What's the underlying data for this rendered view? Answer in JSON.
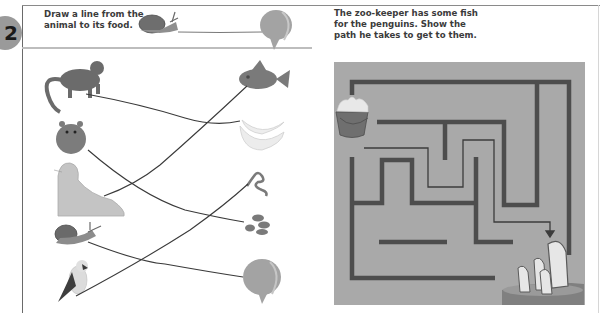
{
  "page": {
    "page_number": "2",
    "colors": {
      "page_number_bg": "#9a9a9a",
      "maze_bg": "#a9a9a9",
      "maze_wall": "#4d4d4d",
      "drawn_line": "#3a3a3a",
      "header_rule": "#bdbdbd"
    }
  },
  "activity_matching": {
    "instruction_line1": "Draw a line from the",
    "instruction_line2": "animal to its food.",
    "example": {
      "animal": "snail",
      "food": "lettuce"
    },
    "animals": [
      {
        "name": "monkey",
        "icon": "monkey-icon"
      },
      {
        "name": "hamster",
        "icon": "hamster-icon"
      },
      {
        "name": "seal",
        "icon": "seal-icon"
      },
      {
        "name": "snail",
        "icon": "snail-icon"
      },
      {
        "name": "bird",
        "icon": "bird-icon"
      }
    ],
    "foods": [
      {
        "name": "fish",
        "icon": "fish-icon"
      },
      {
        "name": "bananas",
        "icon": "banana-icon"
      },
      {
        "name": "worm",
        "icon": "worm-icon"
      },
      {
        "name": "seeds",
        "icon": "seeds-icon"
      },
      {
        "name": "lettuce",
        "icon": "lettuce-icon"
      }
    ],
    "connections": [
      {
        "from": "monkey",
        "to": "bananas"
      },
      {
        "from": "hamster",
        "to": "seeds"
      },
      {
        "from": "seal",
        "to": "fish"
      },
      {
        "from": "snail",
        "to": "lettuce"
      },
      {
        "from": "bird",
        "to": "worm"
      }
    ]
  },
  "activity_maze": {
    "instruction_line1": "The zoo-keeper has some fish",
    "instruction_line2": "for the penguins. Show the",
    "instruction_line3": "path he takes to get to them.",
    "start": "bucket of fish",
    "end": "penguins"
  }
}
